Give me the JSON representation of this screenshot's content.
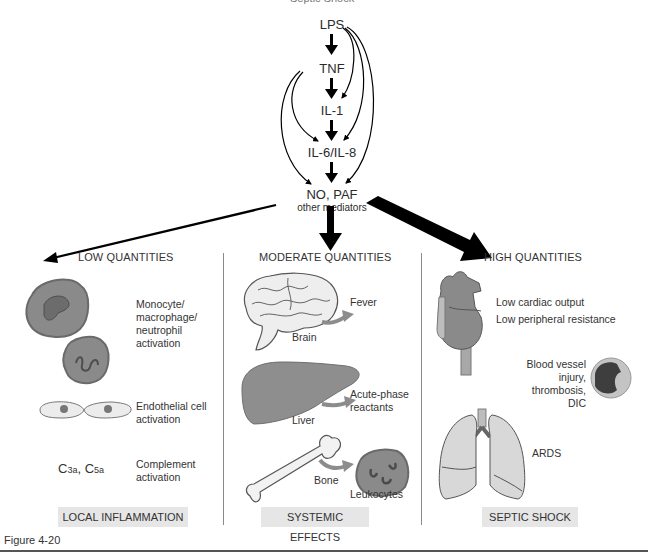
{
  "header": {
    "cutoff_text": "Septic Shock"
  },
  "cascade": {
    "nodes": [
      {
        "id": "lps",
        "label": "LPS"
      },
      {
        "id": "tnf",
        "label": "TNF"
      },
      {
        "id": "il1",
        "label": "IL-1"
      },
      {
        "id": "il6_il8",
        "label": "IL-6/IL-8"
      },
      {
        "id": "no_paf",
        "label": "NO, PAF"
      }
    ],
    "no_paf_sub": "other mediators"
  },
  "columns": [
    {
      "id": "low",
      "title": "LOW QUANTITIES",
      "arrow_weight": "thin",
      "items": [
        {
          "icon": "leukocyte-cells",
          "label_lines": [
            "Monocyte/",
            "macrophage/",
            "neutrophil",
            "activation"
          ]
        },
        {
          "icon": "endothelial-cells",
          "label_lines": [
            "Endothelial cell",
            "activation"
          ]
        },
        {
          "symbol": {
            "c3": "C",
            "c3_sub": "3a",
            "sep": ", ",
            "c5": "C",
            "c5_sub": "5a"
          },
          "label_lines": [
            "Complement",
            "activation"
          ]
        }
      ],
      "footer": "LOCAL INFLAMMATION"
    },
    {
      "id": "moderate",
      "title": "MODERATE QUANTITIES",
      "arrow_weight": "medium",
      "items": [
        {
          "organ": "Brain",
          "effect": "Fever"
        },
        {
          "organ": "Liver",
          "effect_lines": [
            "Acute-phase",
            "reactants"
          ]
        },
        {
          "organ": "Bone",
          "effect": "Leukocytes"
        }
      ],
      "footer": "SYSTEMIC EFFECTS"
    },
    {
      "id": "high",
      "title": "HIGH QUANTITIES",
      "arrow_weight": "thick",
      "items": [
        {
          "organ": "heart",
          "label_lines": [
            "Low cardiac output",
            "Low peripheral resistance"
          ]
        },
        {
          "organ": "blood-vessel",
          "label_lines": [
            "Blood vessel",
            "injury,",
            "thrombosis,",
            "DIC"
          ]
        },
        {
          "organ": "lungs",
          "label": "ARDS"
        }
      ],
      "footer": "SEPTIC SHOCK"
    }
  ],
  "figure": {
    "label": "Figure 4-20"
  },
  "colors": {
    "cell_fill": "#8a8a8a",
    "cell_rim": "#6f6f6f",
    "organ_light": "#e0e0e0",
    "organ_dark": "#7a7a7a",
    "footer_bg": "#e6e6e6",
    "arrow": "#000000",
    "effect_arrow": "#8c8c8c"
  }
}
